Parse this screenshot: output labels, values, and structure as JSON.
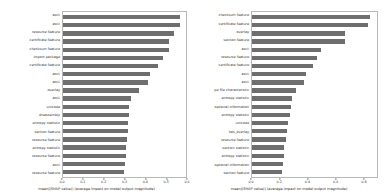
{
  "figure": {
    "background": "#ffffff",
    "bar_color": "#6e6e6e",
    "axis_color": "#b8b8b8"
  },
  "chart_data": [
    {
      "type": "bar",
      "orientation": "horizontal",
      "panel": "left",
      "title": "",
      "xlabel": "mean(|SHAP value|) (average impact on model output magnitude)",
      "ylabel": "",
      "xlim": [
        0.0,
        0.6
      ],
      "grid": false,
      "legend": null,
      "xticks": [
        "0.0",
        "0.1",
        "0.2",
        "0.3",
        "0.4",
        "0.5",
        "0.6"
      ],
      "xtick_values": [
        0.0,
        0.1,
        0.2,
        0.3,
        0.4,
        0.5,
        0.6
      ],
      "categories": [
        "ascii",
        "ascii",
        "resource feature",
        "certificate feature",
        "checksum feature",
        "import package",
        "certificate feature",
        "ascii",
        "ascii",
        "overlay",
        "ascii",
        "unicode",
        "disassembly",
        "entropy statistic",
        "section feature",
        "resource feature",
        "entropy statistic",
        "resource feature",
        "ascii",
        "resource feature"
      ],
      "values": [
        0.573,
        0.572,
        0.542,
        0.519,
        0.518,
        0.487,
        0.462,
        0.425,
        0.413,
        0.373,
        0.333,
        0.323,
        0.32,
        0.318,
        0.315,
        0.311,
        0.309,
        0.306,
        0.3,
        0.296
      ]
    },
    {
      "type": "bar",
      "orientation": "horizontal",
      "panel": "right",
      "title": "",
      "xlabel": "mean(|SHAP value|) (average impact on model output magnitude)",
      "ylabel": "",
      "xlim": [
        0.0,
        0.9
      ],
      "grid": false,
      "legend": null,
      "xticks": [
        "0.0",
        "0.2",
        "0.4",
        "0.6",
        "0.8"
      ],
      "xtick_values": [
        0.0,
        0.2,
        0.4,
        0.6,
        0.8
      ],
      "categories": [
        "checksum feature",
        "certificate feature",
        "overlay",
        "section feature",
        "ascii",
        "resource feature",
        "certificate feature",
        "ascii",
        "ascii",
        "pe file characteristic",
        "entropy statistic",
        "optional information",
        "entropy statistic",
        "unicode",
        "has_overlay",
        "resource feature",
        "section statistic",
        "entropy statistic",
        "optional information",
        "section feature"
      ],
      "values": [
        0.85,
        0.832,
        0.672,
        0.668,
        0.5,
        0.47,
        0.437,
        0.39,
        0.375,
        0.32,
        0.288,
        0.282,
        0.277,
        0.26,
        0.252,
        0.243,
        0.233,
        0.228,
        0.222,
        0.218
      ]
    }
  ]
}
